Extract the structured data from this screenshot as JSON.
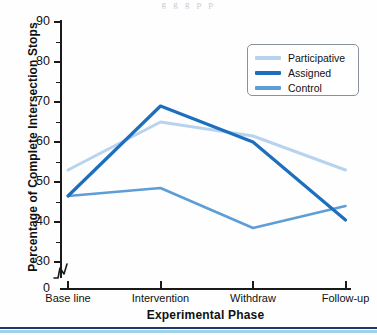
{
  "figure": {
    "top_faint_text": "g g g p p",
    "background": "#fefefe"
  },
  "chart_data": {
    "type": "line",
    "title": "",
    "xlabel": "Experimental Phase",
    "ylabel": "Percentage of Complete Intersection Stops",
    "categories": [
      "Base line",
      "Intervention",
      "Withdraw",
      "Follow-up"
    ],
    "ylim": [
      30,
      90
    ],
    "yticks": [
      30,
      40,
      50,
      60,
      70,
      80,
      90
    ],
    "ytick_labels": [
      "30",
      "40",
      "50",
      "60",
      "70",
      "80",
      "90"
    ],
    "y_axis_origin_label": "0",
    "y_axis_break": true,
    "grid": false,
    "legend_position": "top-right",
    "series": [
      {
        "name": "Participative",
        "color": "#b9d3ef",
        "values": [
          53,
          65,
          61.5,
          53
        ]
      },
      {
        "name": "Assigned",
        "color": "#1d6fbe",
        "values": [
          46.5,
          69,
          60,
          40.5
        ]
      },
      {
        "name": "Control",
        "color": "#5e9ed6",
        "values": [
          46.5,
          48.5,
          38.5,
          44
        ]
      }
    ]
  },
  "legend": {
    "items": [
      {
        "label": "Participative",
        "color": "#b9d3ef"
      },
      {
        "label": "Assigned",
        "color": "#1d6fbe"
      },
      {
        "label": "Control",
        "color": "#5e9ed6"
      }
    ]
  },
  "colors": {
    "axis": "#1a1a1a",
    "rule_dark": "#1b3a6b",
    "rule_light": "#9fd2e6"
  }
}
